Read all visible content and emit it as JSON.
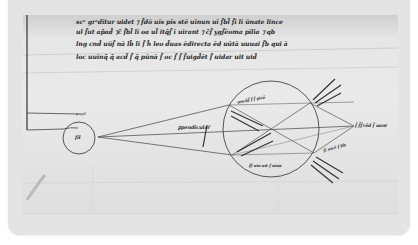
{
  "image": {
    "description": "Medieval manuscript folio with optical diagram: small eye circle with rays to a larger circle, annotated with Latin glosses",
    "text_lines": [
      "scᵉ grᵉdītur uidet ⁊ f̄dō uīs pīs stē uīnun uī ſ̄bl̄ ſ̄ī lī ūnate lince",
      "ul ſ̄ut ap̄ad̄ ⁊c̄ ſ̄bl̄ lī oa ul̄ itq̄ſ̄ ī uīrant ⁊ c̄ſ̄ ygſ̄ēoma pīlīa ⁊ qb",
      "lng cnd̄ uūſ̄ nā lb̄ lī ſ̄ h̄ leo d̄uas ēdirecta ēd uūtā uuuai ſ̄b qui ā",
      "loc uuīnq̄ q̄ acd̄ ſ̄ q̄ pūnā ſ̄ oc ſ̄ ſ̄ ſ̄uigd̄ēt ſ̄ uidar uit uid̄"
    ],
    "labels": {
      "eye": "ſil",
      "pupil": "pupil",
      "center_ray": "ꝑpendicular̄",
      "circle_top": "uncūſ̄ ſ̄ ſ̄ pīcē",
      "convergence": "ſ̄ ſ̄ſ̄ꝛ ēd ſ̄ uant",
      "lower_right": "ſ̄ī uīcē ſ̄ lib",
      "lower_circle": "ſ̄ſ̄ uīn uīt ſ̄ uīna"
    }
  }
}
